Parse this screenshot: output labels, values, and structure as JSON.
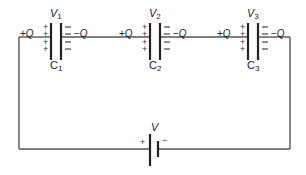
{
  "circuit": {
    "type": "series capacitor circuit",
    "capacitors": [
      {
        "name": "C",
        "sub": "1",
        "voltage": "V",
        "voltage_sub": "1",
        "plus_charge": "+Q",
        "minus_charge": "−Q"
      },
      {
        "name": "C",
        "sub": "2",
        "voltage": "V",
        "voltage_sub": "2",
        "plus_charge": "+Q",
        "minus_charge": "−Q"
      },
      {
        "name": "C",
        "sub": "3",
        "voltage": "V",
        "voltage_sub": "3",
        "plus_charge": "+Q",
        "minus_charge": "−Q"
      }
    ],
    "plate_signs": {
      "positive": "+",
      "negative": "−"
    },
    "battery": {
      "label": "V",
      "positive": "+",
      "negative": "−"
    }
  }
}
